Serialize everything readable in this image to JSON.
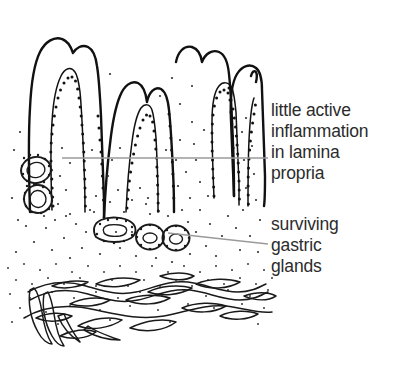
{
  "figure": {
    "background_color": "#ffffff",
    "width": 404,
    "height": 371
  },
  "annotations": [
    {
      "id": "inflammation",
      "text": "little active\ninflammation\nin lamina\npropria",
      "lines": [
        "little active",
        "inflammation",
        "in lamina",
        "propria"
      ],
      "color": "#2b2b2b",
      "leader": {
        "style": "straight-horizontal",
        "color": "#9a9a9a",
        "from_x": 62,
        "from_y": 158,
        "to_x": 268,
        "to_y": 158
      }
    },
    {
      "id": "glands",
      "text": "surviving\ngastric\nglands",
      "lines": [
        "surviving",
        "gastric",
        "glands"
      ],
      "color": "#2b2b2b",
      "leader": {
        "style": "straight-diagonal",
        "color": "#9a9a9a",
        "from_x": 168,
        "from_y": 233,
        "to_x": 268,
        "to_y": 244
      }
    }
  ],
  "structures": {
    "epithelium_color": "#111111",
    "stipple_color": "#2a2a2a",
    "muscle_color": "#1a1a1a",
    "layers": [
      "foveolar surface epithelium",
      "lamina propria",
      "surviving gastric glands",
      "muscularis mucosae"
    ]
  }
}
